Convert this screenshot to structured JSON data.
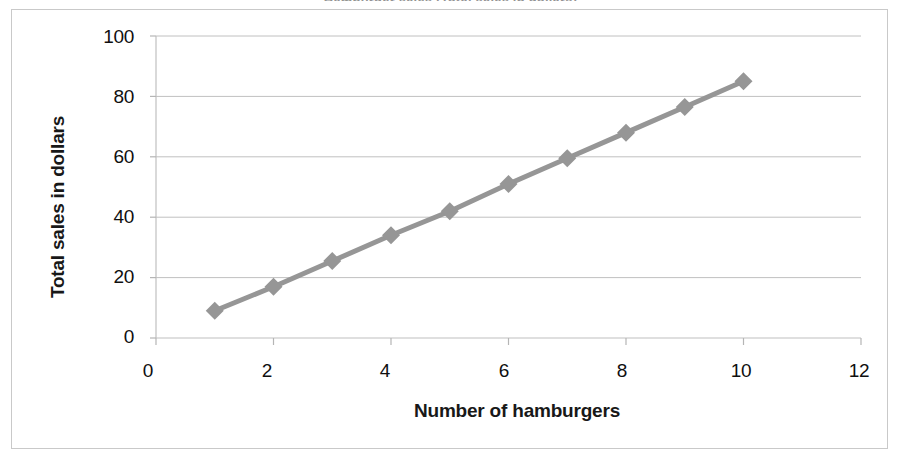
{
  "figure": {
    "clipped_top_text": "Hamburger sales (Total sales in dollars)",
    "frame_color": "#c9c9c9",
    "background": "#ffffff"
  },
  "chart_data": {
    "type": "line",
    "title": "",
    "xlabel": "Number of hamburgers",
    "ylabel": "Total sales in dollars",
    "x": [
      1,
      2,
      3,
      4,
      5,
      6,
      7,
      8,
      9,
      10
    ],
    "values": [
      9,
      17,
      25.5,
      34,
      42,
      51,
      59.5,
      68,
      76.5,
      85
    ],
    "series": [
      {
        "name": "Total sales",
        "x": [
          1,
          2,
          3,
          4,
          5,
          6,
          7,
          8,
          9,
          10
        ],
        "values": [
          9,
          17,
          25.5,
          34,
          42,
          51,
          59.5,
          68,
          76.5,
          85
        ],
        "color": "#969696",
        "marker": "diamond",
        "line_width": 5
      }
    ],
    "xlim": [
      0,
      12
    ],
    "ylim": [
      0,
      100
    ],
    "xticks": [
      "0",
      "2",
      "4",
      "6",
      "8",
      "10",
      "12"
    ],
    "xtick_values": [
      0,
      2,
      4,
      6,
      8,
      10,
      12
    ],
    "yticks": [
      "0",
      "20",
      "40",
      "60",
      "80",
      "100"
    ],
    "ytick_values": [
      0,
      20,
      40,
      60,
      80,
      100
    ],
    "grid": "horizontal",
    "grid_color": "#c0c0c0",
    "legend": "none",
    "annotations": []
  },
  "axis": {
    "y_title": "Total sales in dollars",
    "x_title": "Number of hamburgers",
    "y_labels": [
      "100",
      "80",
      "60",
      "40",
      "20",
      "0"
    ],
    "x_labels": [
      "0",
      "2",
      "4",
      "6",
      "8",
      "10",
      "12"
    ]
  }
}
